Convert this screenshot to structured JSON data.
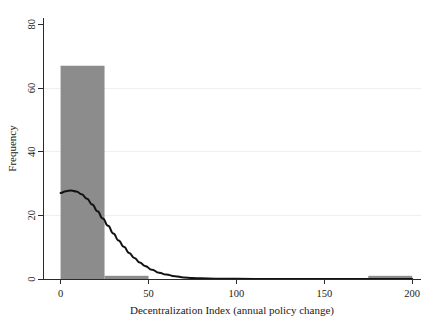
{
  "chart_data": {
    "type": "bar",
    "title": "",
    "subtitle": "",
    "xlabel": "Decentralization Index (annual policy change)",
    "ylabel": "Frequency",
    "xlim": [
      -10,
      205
    ],
    "ylim": [
      0,
      82
    ],
    "xticks": [
      0,
      50,
      100,
      150,
      200
    ],
    "xticklabels": [
      "0",
      "50",
      "100",
      "150",
      "200"
    ],
    "yticks": [
      0,
      20,
      40,
      60,
      80
    ],
    "yticklabels": [
      "0",
      "20",
      "40",
      "60",
      "80"
    ],
    "grid": "horizontal-minor",
    "gridlines_y": [
      20,
      40,
      60
    ],
    "legend": null,
    "legend_position": "none",
    "bar_color": "#8c8c8c",
    "curve_color": "#121212",
    "axis_color": "#2b2b2b",
    "grid_color": "#f0eef2",
    "bin_width": 25,
    "bins": [
      {
        "x0": 0,
        "x1": 25,
        "count": 67
      },
      {
        "x0": 25,
        "x1": 50,
        "count": 1
      },
      {
        "x0": 50,
        "x1": 75,
        "count": 0
      },
      {
        "x0": 75,
        "x1": 100,
        "count": 0
      },
      {
        "x0": 100,
        "x1": 125,
        "count": 0
      },
      {
        "x0": 125,
        "x1": 150,
        "count": 0
      },
      {
        "x0": 150,
        "x1": 175,
        "count": 0
      },
      {
        "x0": 175,
        "x1": 200,
        "count": 1
      }
    ],
    "categories": [
      "0-25",
      "25-50",
      "50-75",
      "75-100",
      "100-125",
      "125-150",
      "150-175",
      "175-200"
    ],
    "values": [
      67,
      1,
      0,
      0,
      0,
      0,
      0,
      1
    ],
    "density_curve": {
      "name": "kernel density (scaled to frequency)",
      "points": [
        {
          "x": 0,
          "y": 27.0
        },
        {
          "x": 3,
          "y": 27.6
        },
        {
          "x": 6,
          "y": 27.8
        },
        {
          "x": 9,
          "y": 27.5
        },
        {
          "x": 12,
          "y": 26.6
        },
        {
          "x": 15,
          "y": 25.2
        },
        {
          "x": 18,
          "y": 23.4
        },
        {
          "x": 21,
          "y": 21.3
        },
        {
          "x": 24,
          "y": 19.0
        },
        {
          "x": 27,
          "y": 16.7
        },
        {
          "x": 30,
          "y": 14.3
        },
        {
          "x": 33,
          "y": 12.1
        },
        {
          "x": 36,
          "y": 10.1
        },
        {
          "x": 39,
          "y": 8.2
        },
        {
          "x": 42,
          "y": 6.6
        },
        {
          "x": 45,
          "y": 5.2
        },
        {
          "x": 48,
          "y": 4.1
        },
        {
          "x": 52,
          "y": 2.9
        },
        {
          "x": 56,
          "y": 2.0
        },
        {
          "x": 60,
          "y": 1.4
        },
        {
          "x": 65,
          "y": 0.9
        },
        {
          "x": 70,
          "y": 0.5
        },
        {
          "x": 75,
          "y": 0.3
        },
        {
          "x": 80,
          "y": 0.2
        },
        {
          "x": 88,
          "y": 0.1
        },
        {
          "x": 100,
          "y": 0.05
        },
        {
          "x": 120,
          "y": 0.02
        },
        {
          "x": 150,
          "y": 0.01
        },
        {
          "x": 180,
          "y": 0.01
        },
        {
          "x": 200,
          "y": 0.01
        }
      ]
    }
  }
}
